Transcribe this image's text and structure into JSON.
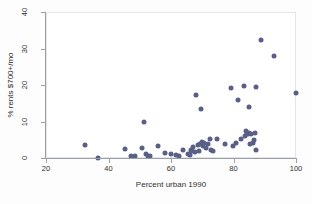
{
  "chart_data": {
    "type": "scatter",
    "title": "",
    "xlabel": "Percent urban 1990",
    "ylabel": "% rents $700+/mo",
    "xlim": [
      20,
      100
    ],
    "ylim": [
      0,
      40
    ],
    "xticks": [
      20,
      40,
      60,
      80,
      100
    ],
    "yticks": [
      0,
      10,
      20,
      30,
      40
    ],
    "grid": false,
    "legend": null,
    "marker_color": "#5a5f86",
    "points": [
      {
        "x": 32.2,
        "y": 3.8
      },
      {
        "x": 36.3,
        "y": 0.3
      },
      {
        "x": 44.8,
        "y": 2.7
      },
      {
        "x": 46.9,
        "y": 0.7
      },
      {
        "x": 48.2,
        "y": 0.9
      },
      {
        "x": 50.5,
        "y": 3.1
      },
      {
        "x": 51.0,
        "y": 10.1
      },
      {
        "x": 51.8,
        "y": 1.3
      },
      {
        "x": 52.4,
        "y": 0.8
      },
      {
        "x": 52.9,
        "y": 0.8
      },
      {
        "x": 55.6,
        "y": 3.5
      },
      {
        "x": 57.6,
        "y": 1.6
      },
      {
        "x": 59.8,
        "y": 1.3
      },
      {
        "x": 61.3,
        "y": 1.1
      },
      {
        "x": 62.1,
        "y": 0.9
      },
      {
        "x": 63.4,
        "y": 2.6
      },
      {
        "x": 65.2,
        "y": 1.4
      },
      {
        "x": 65.6,
        "y": 1.1
      },
      {
        "x": 66.0,
        "y": 2.5
      },
      {
        "x": 66.4,
        "y": 2.3
      },
      {
        "x": 66.8,
        "y": 3.3
      },
      {
        "x": 67.3,
        "y": 1.9
      },
      {
        "x": 67.6,
        "y": 17.5
      },
      {
        "x": 68.2,
        "y": 3.9
      },
      {
        "x": 68.6,
        "y": 2.2
      },
      {
        "x": 68.9,
        "y": 4.0
      },
      {
        "x": 69.2,
        "y": 13.8
      },
      {
        "x": 69.5,
        "y": 4.6
      },
      {
        "x": 69.8,
        "y": 3.6
      },
      {
        "x": 70.3,
        "y": 4.3
      },
      {
        "x": 70.9,
        "y": 3.1
      },
      {
        "x": 71.4,
        "y": 4.2
      },
      {
        "x": 72.0,
        "y": 5.5
      },
      {
        "x": 72.6,
        "y": 2.6
      },
      {
        "x": 73.1,
        "y": 2.3
      },
      {
        "x": 74.3,
        "y": 5.6
      },
      {
        "x": 76.8,
        "y": 4.0
      },
      {
        "x": 78.8,
        "y": 19.5
      },
      {
        "x": 79.4,
        "y": 3.5
      },
      {
        "x": 80.6,
        "y": 4.3
      },
      {
        "x": 81.2,
        "y": 16.1
      },
      {
        "x": 82.0,
        "y": 5.4
      },
      {
        "x": 83.0,
        "y": 19.9
      },
      {
        "x": 83.4,
        "y": 6.4
      },
      {
        "x": 83.8,
        "y": 7.8
      },
      {
        "x": 84.0,
        "y": 7.0
      },
      {
        "x": 84.3,
        "y": 6.9
      },
      {
        "x": 84.5,
        "y": 7.2
      },
      {
        "x": 84.6,
        "y": 14.2
      },
      {
        "x": 84.8,
        "y": 4.0
      },
      {
        "x": 85.2,
        "y": 6.8
      },
      {
        "x": 85.8,
        "y": 4.3
      },
      {
        "x": 86.1,
        "y": 5.2
      },
      {
        "x": 86.5,
        "y": 7.0
      },
      {
        "x": 86.9,
        "y": 2.4
      },
      {
        "x": 87.0,
        "y": 19.8
      },
      {
        "x": 88.6,
        "y": 32.6
      },
      {
        "x": 92.6,
        "y": 28.2
      },
      {
        "x": 99.8,
        "y": 18.0
      }
    ]
  }
}
